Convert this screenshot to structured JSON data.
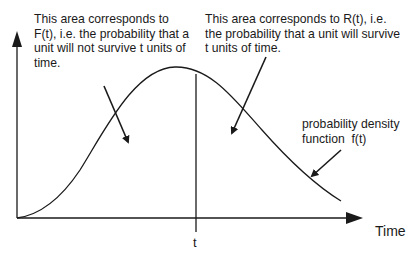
{
  "annotations": {
    "F_area": [
      "This area corresponds to",
      "F(t), i.e. the probability that a",
      "unit will not survive t units of",
      "time."
    ],
    "R_area": [
      "This area corresponds to R(t), i.e.",
      "the probability that a unit will survive",
      "t units of time."
    ],
    "pdf": [
      "probability density",
      "function  f(t)"
    ]
  },
  "axes": {
    "x_label": "Time",
    "t_marker": "t"
  },
  "colors": {
    "line": "#1a1a1a",
    "background": "#ffffff"
  }
}
